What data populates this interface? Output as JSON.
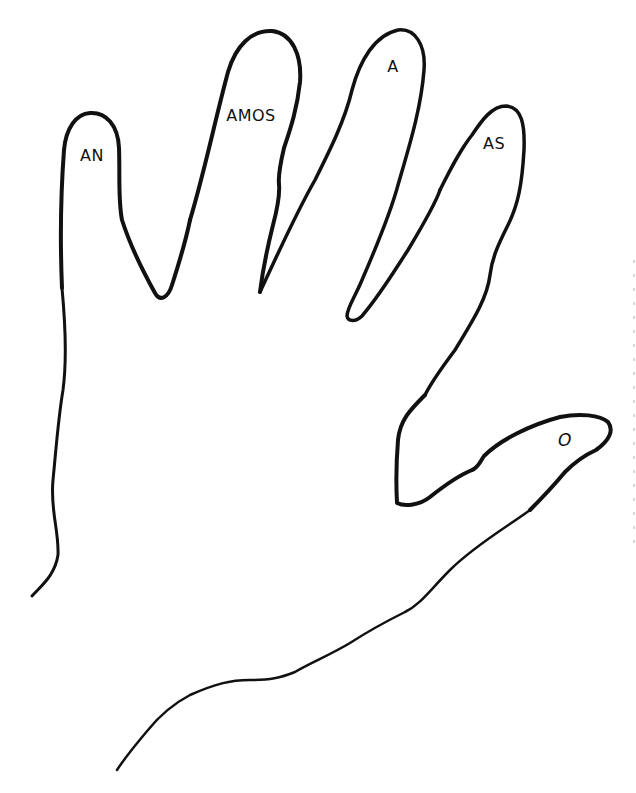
{
  "diagram": {
    "fingers": [
      {
        "id": "pinky",
        "label": "AN"
      },
      {
        "id": "ring",
        "label": "AMOS"
      },
      {
        "id": "middle",
        "label": "A"
      },
      {
        "id": "index",
        "label": "AS"
      },
      {
        "id": "thumb",
        "label": "O"
      }
    ],
    "colors": {
      "line": "#111111",
      "background": "#ffffff"
    }
  }
}
